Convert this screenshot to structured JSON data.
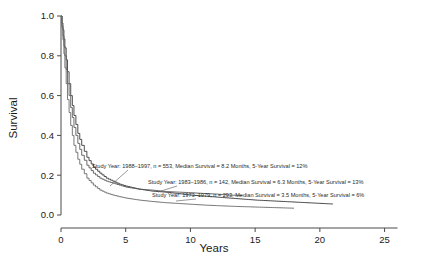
{
  "chart_data": {
    "type": "line",
    "title": "",
    "xlabel": "Years",
    "ylabel": "Survival",
    "xlim": [
      0,
      26.5
    ],
    "ylim": [
      0,
      1.0
    ],
    "xticks": [
      "0",
      "5",
      "10",
      "15",
      "20",
      "25"
    ],
    "xtick_values": [
      0,
      5,
      10,
      15,
      20,
      25
    ],
    "yticks": [
      "0.0",
      "0.2",
      "0.4",
      "0.6",
      "0.8",
      "1.0"
    ],
    "ytick_values": [
      0,
      0.2,
      0.4,
      0.6,
      0.8,
      1.0
    ],
    "grid": false,
    "legend_position": "inline-annotations",
    "series": [
      {
        "name": "Study Year: 1988-1997",
        "study_year": "1988–1997",
        "n": 553,
        "median_survival_months": 8.2,
        "five_year_survival_pct": 12,
        "color": "#3a3a3a",
        "x": [
          0,
          0.15,
          0.3,
          0.5,
          0.75,
          1.0,
          1.3,
          1.6,
          2.0,
          2.5,
          3.0,
          3.5,
          4.0,
          4.5,
          5.0,
          6.0,
          7.0,
          8.0,
          9.0,
          10.0,
          11.0,
          12.0,
          13.0,
          14.0,
          15.0,
          16.5,
          18.0,
          19.5,
          21.0
        ],
        "y": [
          1.0,
          0.93,
          0.84,
          0.72,
          0.6,
          0.5,
          0.41,
          0.35,
          0.29,
          0.24,
          0.21,
          0.185,
          0.17,
          0.155,
          0.145,
          0.13,
          0.12,
          0.115,
          0.108,
          0.1,
          0.095,
          0.09,
          0.085,
          0.08,
          0.075,
          0.07,
          0.065,
          0.06,
          0.055
        ]
      },
      {
        "name": "Study Year: 1983-1986",
        "study_year": "1983–1986",
        "n": 142,
        "median_survival_months": 6.3,
        "five_year_survival_pct": 13,
        "color": "#5a5a5a",
        "x": [
          0,
          0.15,
          0.3,
          0.5,
          0.75,
          1.0,
          1.3,
          1.6,
          2.0,
          2.5,
          3.0,
          3.5,
          4.0,
          4.5,
          5.0,
          6.0,
          7.0,
          8.0,
          9.0,
          10.0,
          11.0,
          12.0,
          13.0,
          14.0
        ],
        "y": [
          1.0,
          0.9,
          0.8,
          0.66,
          0.54,
          0.44,
          0.36,
          0.3,
          0.25,
          0.21,
          0.185,
          0.17,
          0.16,
          0.15,
          0.14,
          0.13,
          0.125,
          0.118,
          0.115,
          0.112,
          0.108,
          0.105,
          0.1,
          0.098
        ]
      },
      {
        "name": "Study Year: 1973-1979",
        "study_year": "1973–1979",
        "n": 293,
        "median_survival_months": 3.5,
        "five_year_survival_pct": 6,
        "color": "#6a6a6a",
        "x": [
          0,
          0.15,
          0.3,
          0.5,
          0.75,
          1.0,
          1.3,
          1.6,
          2.0,
          2.5,
          3.0,
          3.5,
          4.0,
          4.5,
          5.0,
          6.0,
          7.0,
          8.0,
          9.0,
          10.0,
          11.0,
          12.0,
          13.5,
          15.0,
          16.5,
          18.0
        ],
        "y": [
          1.0,
          0.88,
          0.74,
          0.58,
          0.45,
          0.35,
          0.28,
          0.23,
          0.185,
          0.15,
          0.125,
          0.11,
          0.1,
          0.092,
          0.085,
          0.075,
          0.068,
          0.062,
          0.058,
          0.054,
          0.05,
          0.047,
          0.043,
          0.04,
          0.037,
          0.034
        ]
      }
    ],
    "annotations": [
      {
        "id": "annotation-1988-1997",
        "text": "Study Year: 1988–1997, n = 553, Median Survival = 8.2 Months, 5-Year Survival = 12%",
        "x_px": 92,
        "y_px": 168
      },
      {
        "id": "annotation-1983-1986",
        "text": "Study Year: 1983–1986, n = 142, Median Survival = 6.3 Months, 5-Year Survival = 13%",
        "x_px": 148,
        "y_px": 184
      },
      {
        "id": "annotation-1973-1979",
        "text": "Study Year: 1973–1979, n = 293, Median Survival = 3.5 Months, 5-Year Survival = 6%",
        "x_px": 152,
        "y_px": 197
      }
    ]
  }
}
